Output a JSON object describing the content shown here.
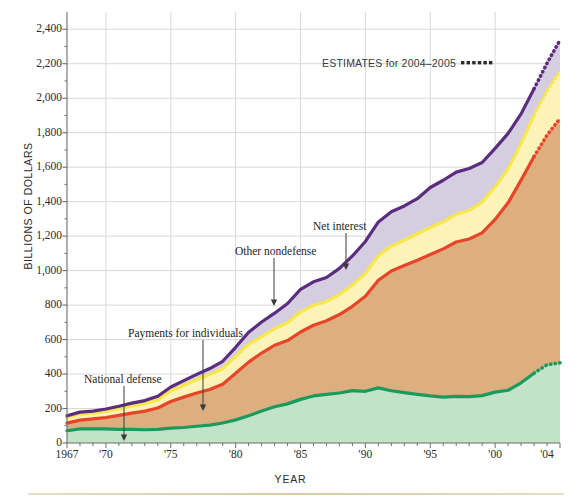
{
  "chart_data": {
    "type": "area",
    "title": "",
    "subtitle": "",
    "xlabel": "YEAR",
    "ylabel": "BILLIONS OF DOLLARS",
    "xlim": [
      1967,
      2005
    ],
    "ylim": [
      0,
      2500
    ],
    "grid": true,
    "stacked": true,
    "legend_position": "inline-annotations",
    "ytick_labels": [
      "0",
      "200",
      "400",
      "600",
      "800",
      "1,000",
      "1,200",
      "1,400",
      "1,600",
      "1,800",
      "2,000",
      "2,200",
      "2,400"
    ],
    "ytick_values": [
      0,
      200,
      400,
      600,
      800,
      1000,
      1200,
      1400,
      1600,
      1800,
      2000,
      2200,
      2400
    ],
    "xtick_labels": [
      "1967",
      "'70",
      "'75",
      "'80",
      "'85",
      "'90",
      "'95",
      "'00",
      "'04"
    ],
    "xtick_values": [
      1967,
      1970,
      1975,
      1980,
      1985,
      1990,
      1995,
      2000,
      2004
    ],
    "estimates_note": "ESTIMATES for 2004–2005",
    "estimates_marker": "▪▪▪▪▪▪",
    "estimates_start_year": 2003,
    "x": [
      1967,
      1968,
      1969,
      1970,
      1971,
      1972,
      1973,
      1974,
      1975,
      1976,
      1977,
      1978,
      1979,
      1980,
      1981,
      1982,
      1983,
      1984,
      1985,
      1986,
      1987,
      1988,
      1989,
      1990,
      1991,
      1992,
      1993,
      1994,
      1995,
      1996,
      1997,
      1998,
      1999,
      2000,
      2001,
      2002,
      2003,
      2004,
      2005
    ],
    "series": [
      {
        "name": "National defense",
        "color": "#1a9b5e",
        "fill": "#c3e3c8",
        "values": [
          71,
          82,
          82,
          82,
          79,
          79,
          77,
          79,
          86,
          90,
          97,
          104,
          116,
          134,
          158,
          185,
          210,
          227,
          253,
          273,
          282,
          290,
          304,
          300,
          320,
          303,
          292,
          282,
          273,
          266,
          271,
          269,
          275,
          295,
          306,
          349,
          405,
          454,
          465
        ]
      },
      {
        "name": "Payments for individuals",
        "color": "#e8442a",
        "fill": "#ddae7e",
        "values": [
          44,
          51,
          58,
          66,
          81,
          94,
          108,
          124,
          155,
          176,
          193,
          206,
          225,
          270,
          311,
          337,
          357,
          367,
          391,
          410,
          427,
          455,
          489,
          551,
          624,
          695,
          737,
          778,
          820,
          860,
          895,
          914,
          944,
          1002,
          1087,
          1176,
          1257,
          1331,
          1418
        ]
      },
      {
        "name": "Other nondefense",
        "color": "#f7e74a",
        "fill": "#fbf3b8",
        "values": [
          33,
          35,
          33,
          35,
          38,
          43,
          44,
          47,
          61,
          69,
          78,
          87,
          90,
          98,
          104,
          95,
          96,
          104,
          117,
          116,
          112,
          116,
          123,
          134,
          143,
          144,
          147,
          154,
          157,
          157,
          161,
          166,
          178,
          189,
          197,
          213,
          240,
          258,
          276
        ]
      },
      {
        "name": "Net interest",
        "color": "#5b2d7e",
        "fill": "#d5cde0",
        "values": [
          10,
          11,
          12,
          14,
          15,
          15,
          17,
          21,
          23,
          27,
          30,
          35,
          43,
          53,
          69,
          85,
          90,
          111,
          130,
          136,
          139,
          152,
          169,
          184,
          195,
          199,
          199,
          203,
          232,
          241,
          244,
          243,
          230,
          223,
          206,
          171,
          153,
          160,
          178
        ]
      }
    ],
    "annotations": [
      {
        "label": "National defense",
        "text_x": 84,
        "text_y": 374,
        "arrow_x": 124,
        "arrow_y": 386,
        "arrow_end_y": 441
      },
      {
        "label": "Payments for individuals",
        "text_x": 128,
        "text_y": 328,
        "arrow_x": 203,
        "arrow_y": 340,
        "arrow_end_y": 411
      },
      {
        "label": "Other nondefense",
        "text_x": 235,
        "text_y": 246,
        "arrow_x": 274,
        "arrow_y": 258,
        "arrow_end_y": 306
      },
      {
        "label": "Net interest",
        "text_x": 313,
        "text_y": 221,
        "arrow_x": 346,
        "arrow_y": 233,
        "arrow_end_y": 270
      }
    ]
  },
  "axes": {
    "plot_left": 67,
    "plot_right": 560,
    "plot_top": 12,
    "plot_bottom": 443
  },
  "colors": {
    "axis": "#6d6d6d",
    "grid": "#d8d8d8",
    "text": "#231f20",
    "rule": "#d9c9a6"
  }
}
